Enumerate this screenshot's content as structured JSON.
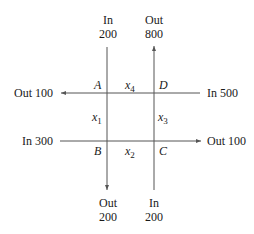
{
  "diagram": {
    "type": "traffic-flow-network",
    "colors": {
      "line": "#555555",
      "text": "#1a1a1a",
      "background": "#ffffff"
    },
    "nodes": [
      {
        "id": "A",
        "label": "A"
      },
      {
        "id": "B",
        "label": "B"
      },
      {
        "id": "C",
        "label": "C"
      },
      {
        "id": "D",
        "label": "D"
      }
    ],
    "internal_flows": [
      {
        "label": "x",
        "subscript": "1",
        "between": [
          "A",
          "B"
        ]
      },
      {
        "label": "x",
        "subscript": "2",
        "between": [
          "B",
          "C"
        ]
      },
      {
        "label": "x",
        "subscript": "3",
        "between": [
          "C",
          "D"
        ]
      },
      {
        "label": "x",
        "subscript": "4",
        "between": [
          "A",
          "D"
        ]
      }
    ],
    "external_flows": {
      "top_left": {
        "direction": "In",
        "value": "200",
        "node": "A"
      },
      "top_right": {
        "direction": "Out",
        "value": "800",
        "node": "D"
      },
      "left_top": {
        "text": "Out 100",
        "node": "A"
      },
      "right_top": {
        "text": "In 500",
        "node": "D"
      },
      "left_bottom": {
        "text": "In 300",
        "node": "B"
      },
      "right_bottom": {
        "text": "Out 100",
        "node": "C"
      },
      "bottom_left": {
        "direction": "Out",
        "value": "200",
        "node": "B"
      },
      "bottom_right": {
        "direction": "In",
        "value": "200",
        "node": "C"
      }
    }
  }
}
